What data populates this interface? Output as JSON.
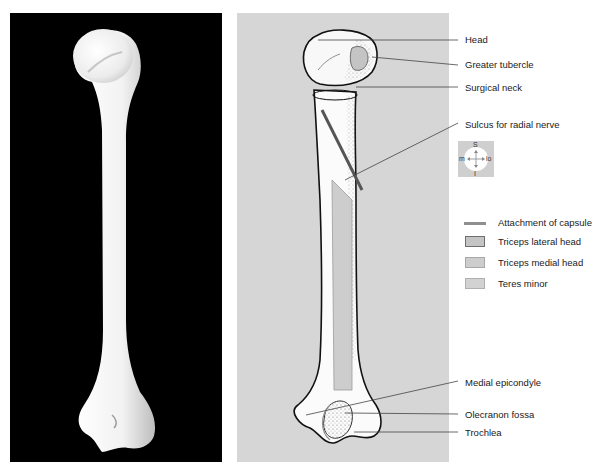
{
  "figure": {
    "left_panel": {
      "description": "Photograph of right humerus, posterior view",
      "background": "#000000"
    },
    "right_panel": {
      "description": "Line drawing of humerus, posterior view",
      "background": "#d6d6d6"
    }
  },
  "labels": [
    {
      "id": "head",
      "text": "Head",
      "x": 465,
      "y": 34
    },
    {
      "id": "greater-tubercle",
      "text": "Greater tubercle",
      "x": 465,
      "y": 59
    },
    {
      "id": "surgical-neck",
      "text": "Surgical neck",
      "x": 465,
      "y": 82
    },
    {
      "id": "sulcus-radial-nerve",
      "text": "Sulcus for radial nerve",
      "x": 465,
      "y": 119
    },
    {
      "id": "medial-epicondyle",
      "text": "Medial epicondyle",
      "x": 465,
      "y": 377
    },
    {
      "id": "olecranon-fossa",
      "text": "Olecranon fossa",
      "x": 465,
      "y": 410
    },
    {
      "id": "trochlea",
      "text": "Trochlea",
      "x": 465,
      "y": 428
    }
  ],
  "compass": {
    "superior": "S",
    "inferior": "I",
    "medial": "m",
    "lateral": "lo"
  },
  "legend": [
    {
      "id": "attachment-capsule",
      "text": "Attachment of capsule",
      "kind": "line",
      "color": "#8f8f8f"
    },
    {
      "id": "triceps-lateral-head",
      "text": "Triceps lateral head",
      "kind": "box",
      "fill": "#c4c4c4",
      "stroke": "#6e6e6e"
    },
    {
      "id": "triceps-medial-head",
      "text": "Triceps medial head",
      "kind": "box",
      "fill": "#cdcdcd",
      "stroke": "#a8a8a8"
    },
    {
      "id": "teres-minor",
      "text": "Teres minor",
      "kind": "box",
      "fill": "#d2d2d2",
      "stroke": "#b0b0b0"
    }
  ]
}
